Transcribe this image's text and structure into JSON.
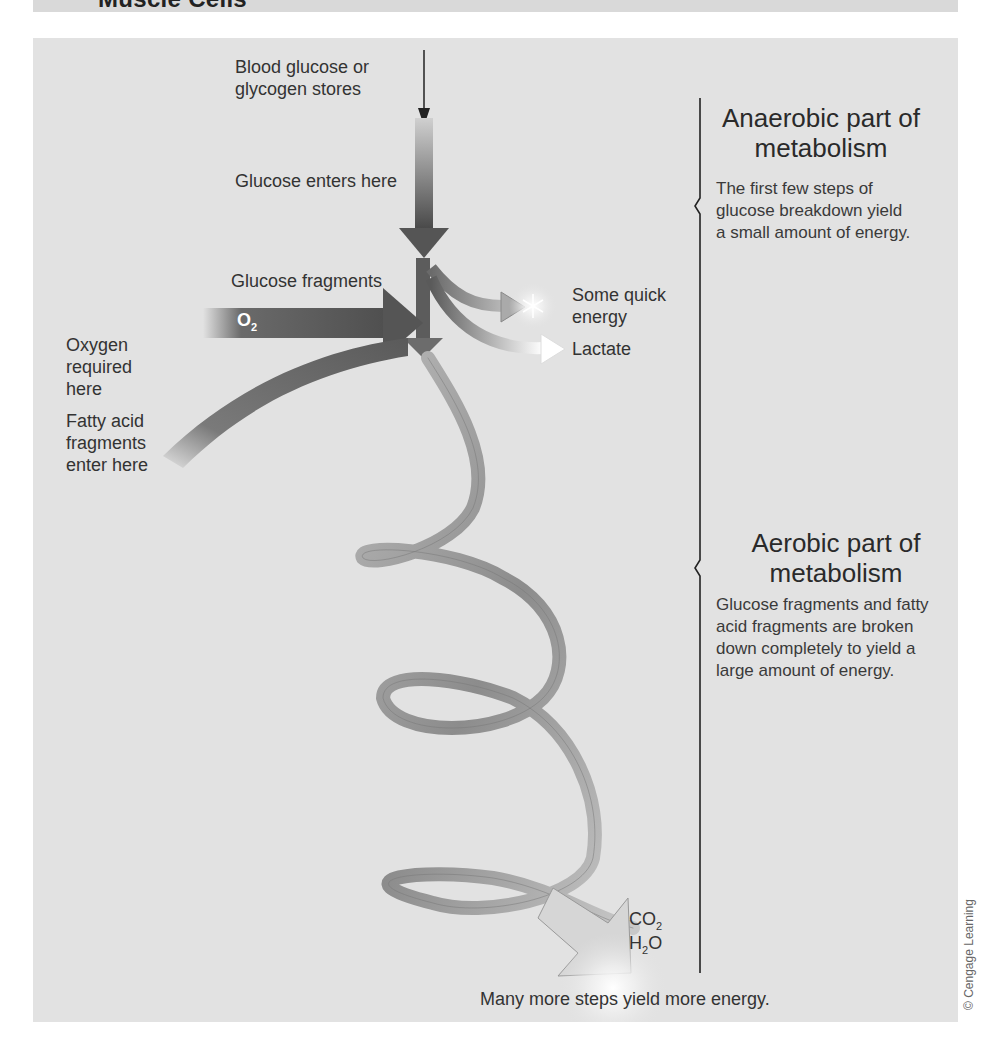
{
  "header": {
    "title": "Muscle Cells"
  },
  "diagram": {
    "labels": {
      "blood_glucose": "Blood glucose or glycogen stores",
      "glucose_enters": "Glucose enters here",
      "glucose_fragments": "Glucose fragments",
      "oxygen": "Oxygen required here",
      "fatty_acid": "Fatty acid fragments enter here",
      "quick_energy": "Some quick energy",
      "lactate": "Lactate",
      "o2_main": "O",
      "o2_sub": "2",
      "co2_main": "CO",
      "co2_sub": "2",
      "h2o_h": "H",
      "h2o_sub": "2",
      "h2o_o": "O",
      "bottom": "Many more steps yield more energy."
    },
    "anaerobic": {
      "heading": "Anaerobic part of metabolism",
      "description": "The first few steps of glucose breakdown yield a small amount of energy."
    },
    "aerobic": {
      "heading": "Aerobic part of metabolism",
      "description": "Glucose fragments and fatty acid fragments are broken down completely to yield a large amount of energy."
    },
    "colors": {
      "panel_bg": "#e2e2e2",
      "arrow_dark": "#5a5a5a",
      "ribbon": "#a8a8a8"
    }
  },
  "credit": "© Cengage Learning"
}
